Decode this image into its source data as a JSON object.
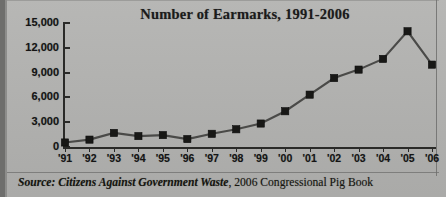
{
  "chart_data": {
    "type": "line",
    "title": "Number of Earmarks, 1991-2006",
    "xlabel": "",
    "ylabel": "",
    "categories": [
      "'91",
      "'92",
      "'93",
      "'94",
      "'95",
      "'96",
      "'97",
      "'98",
      "'99",
      "'00",
      "'01",
      "'02",
      "'03",
      "'04",
      "'05",
      "'06"
    ],
    "values": [
      546,
      892,
      1701,
      1318,
      1439,
      958,
      1596,
      2143,
      2838,
      4326,
      6333,
      8341,
      9362,
      10656,
      13997,
      9963
    ],
    "ylim": [
      0,
      15000
    ],
    "yticks": [
      0,
      3000,
      6000,
      9000,
      12000,
      15000
    ],
    "ytick_labels": [
      "0",
      "3,000",
      "6,000",
      "9,000",
      "12,000",
      "15,000"
    ],
    "grid": false,
    "legend": null,
    "marker": "square",
    "line_color": "#4a4a48",
    "marker_color": "#181816"
  },
  "source": {
    "lead": "Source:",
    "org": " Citizens Against Government Waste",
    "rest": ", 2006 Congressional Pig Book"
  },
  "colors": {
    "background": "#b3b3b1",
    "axis": "#2a2a28",
    "text": "#141414"
  }
}
